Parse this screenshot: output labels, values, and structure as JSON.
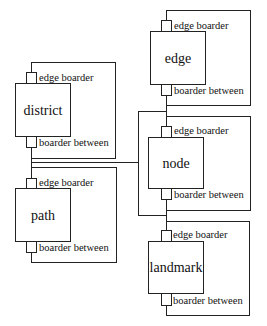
{
  "diagram": {
    "type": "block-diagram",
    "port_labels": {
      "top": "edge boarder",
      "bottom": "boarder between"
    },
    "blocks": [
      {
        "id": "district",
        "label": "district",
        "top_port": "edge boarder",
        "bottom_port": "boarder between"
      },
      {
        "id": "path",
        "label": "path",
        "top_port": "edge boarder",
        "bottom_port": "boarder between"
      },
      {
        "id": "edge",
        "label": "edge",
        "top_port": "edge boarder",
        "bottom_port": "boarder between"
      },
      {
        "id": "node",
        "label": "node",
        "top_port": "edge boarder",
        "bottom_port": "boarder between"
      },
      {
        "id": "landmark",
        "label": "landmark",
        "top_port": "edge boarder",
        "bottom_port": "boarder between"
      }
    ],
    "connections": [
      {
        "from": "district.bottom",
        "to": "path.top"
      },
      {
        "from": "edge.bottom",
        "to": "node.top"
      },
      {
        "from": "node.bottom",
        "to": "landmark.top"
      },
      {
        "from": "district-path-link",
        "to": "edge-node-landmark-bracket"
      }
    ]
  }
}
